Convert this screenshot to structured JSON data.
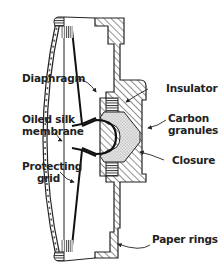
{
  "diagram": {
    "labels_left": [
      {
        "id": "diaphragm",
        "text": "Diaphragm"
      },
      {
        "id": "oiled-silk-line1",
        "text": "Oiled silk"
      },
      {
        "id": "oiled-silk-line2",
        "text": "membrane"
      },
      {
        "id": "protecting-grid-line1",
        "text": "Protecting"
      },
      {
        "id": "protecting-grid-line2",
        "text": "grid"
      }
    ],
    "labels_right": [
      {
        "id": "insulator",
        "text": "Insulator"
      },
      {
        "id": "carbon-line1",
        "text": "Carbon"
      },
      {
        "id": "carbon-line2",
        "text": "granules"
      },
      {
        "id": "closure",
        "text": "Closure"
      },
      {
        "id": "paper-rings",
        "text": "Paper rings"
      }
    ],
    "colors": {
      "ink": "#222222",
      "background": "#ffffff",
      "granules": "#d8d8d8"
    }
  }
}
